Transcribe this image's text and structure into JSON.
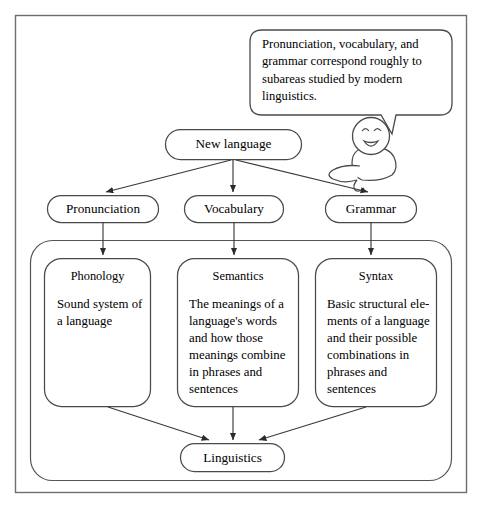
{
  "figure": {
    "stroke_color": "#3a3a3a",
    "background_color": "#ffffff",
    "text_color": "#000000"
  },
  "speech_bubble": {
    "name": "speech-bubble",
    "text": "Pronunciation, vocabulary, and grammar correspond roughly to subareas studied by modern linguistics."
  },
  "character": {
    "name": "smiling-character",
    "expression": "smiling"
  },
  "nodes": {
    "root": {
      "label": "New language"
    },
    "branches": [
      {
        "label": "Pronunciation"
      },
      {
        "label": "Vocabulary"
      },
      {
        "label": "Grammar"
      }
    ],
    "sink": {
      "label": "Linguistics"
    }
  },
  "subareas": [
    {
      "title": "Phonology",
      "body": "Sound system of a language"
    },
    {
      "title": "Semantics",
      "body": "The meanings of a language's words and how those meanings combine in phrases and sentences"
    },
    {
      "title": "Syntax",
      "body": "Basic structural ele-\nments of a language\nand their possible\ncombinations in\nphrases and\nsentences"
    }
  ]
}
